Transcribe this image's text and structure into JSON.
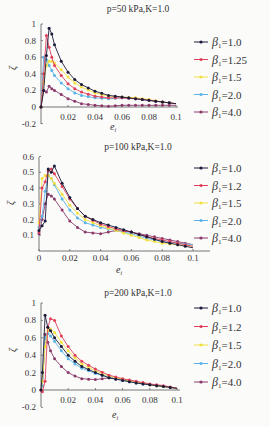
{
  "chart_data": [
    {
      "type": "line",
      "title": "p=50 kPa,K=1.0",
      "xlabel": "e_i",
      "ylabel": "ζ",
      "xlim": [
        0,
        0.1
      ],
      "ylim": [
        -0.2,
        1.0
      ],
      "xticks": [
        "0.02",
        "0.04",
        "0.06",
        "0.08",
        "0.1"
      ],
      "yticks": [
        "-0.2",
        "0",
        "0.2",
        "0.4",
        "0.6",
        "0.8",
        "1"
      ],
      "legend_position": "right",
      "series": [
        {
          "name": "β1=1.0",
          "color": "#1a1a3a",
          "x": [
            0,
            0.002,
            0.004,
            0.006,
            0.008,
            0.01,
            0.015,
            0.02,
            0.025,
            0.03,
            0.04,
            0.05,
            0.06,
            0.07,
            0.08,
            0.09,
            0.1
          ],
          "y": [
            0,
            0.2,
            0.62,
            0.95,
            0.88,
            0.75,
            0.55,
            0.42,
            0.33,
            0.27,
            0.19,
            0.14,
            0.12,
            0.1,
            0.08,
            0.06,
            0.04
          ]
        },
        {
          "name": "β1=1.25",
          "color": "#e0405a",
          "x": [
            0,
            0.002,
            0.004,
            0.006,
            0.008,
            0.01,
            0.015,
            0.02,
            0.025,
            0.03,
            0.04,
            0.05,
            0.06,
            0.07,
            0.08,
            0.09,
            0.1
          ],
          "y": [
            0,
            0.4,
            0.86,
            0.72,
            0.6,
            0.5,
            0.38,
            0.28,
            0.22,
            0.18,
            0.13,
            0.11,
            0.11,
            0.1,
            0.08,
            0.06,
            0.04
          ]
        },
        {
          "name": "β1=1.5",
          "color": "#f2e040",
          "x": [
            0,
            0.002,
            0.004,
            0.006,
            0.008,
            0.01,
            0.015,
            0.02,
            0.025,
            0.03,
            0.04,
            0.05,
            0.06,
            0.07,
            0.08,
            0.09,
            0.1
          ],
          "y": [
            0,
            0.3,
            0.5,
            0.55,
            0.55,
            0.53,
            0.45,
            0.36,
            0.29,
            0.24,
            0.17,
            0.13,
            0.12,
            0.11,
            0.09,
            0.06,
            0.04
          ]
        },
        {
          "name": "β1=2.0",
          "color": "#5ab4e6",
          "x": [
            0,
            0.002,
            0.004,
            0.006,
            0.008,
            0.01,
            0.015,
            0.02,
            0.025,
            0.03,
            0.04,
            0.05,
            0.06,
            0.07,
            0.08,
            0.09,
            0.1
          ],
          "y": [
            0,
            0.6,
            0.57,
            0.5,
            0.44,
            0.38,
            0.29,
            0.22,
            0.17,
            0.14,
            0.11,
            0.1,
            0.11,
            0.1,
            0.08,
            0.06,
            0.04
          ]
        },
        {
          "name": "β1=4.0",
          "color": "#8a3a6a",
          "x": [
            0,
            0.002,
            0.004,
            0.006,
            0.008,
            0.01,
            0.015,
            0.02,
            0.025,
            0.03,
            0.04,
            0.05,
            0.06,
            0.07,
            0.08,
            0.09,
            0.1
          ],
          "y": [
            0,
            0.2,
            0.18,
            0.25,
            0.22,
            0.2,
            0.15,
            0.1,
            0.07,
            0.04,
            0.02,
            0.01,
            0.02,
            0.02,
            0.02,
            0.02,
            0.02
          ]
        }
      ]
    },
    {
      "type": "line",
      "title": "p=100 kPa,K=1.0",
      "xlabel": "e_i",
      "ylabel": "ζ",
      "xlim": [
        0,
        0.11
      ],
      "ylim": [
        0,
        0.6
      ],
      "xticks": [
        "0",
        "0.02",
        "0.04",
        "0.06",
        "0.08",
        "0.1"
      ],
      "yticks": [
        "0.1",
        "0.2",
        "0.3",
        "0.4",
        "0.5",
        "0.6"
      ],
      "legend_position": "right",
      "series": [
        {
          "name": "β1=1.0",
          "color": "#1a1a3a",
          "x": [
            0,
            0.002,
            0.004,
            0.006,
            0.008,
            0.01,
            0.015,
            0.02,
            0.025,
            0.03,
            0.04,
            0.05,
            0.06,
            0.07,
            0.08,
            0.09,
            0.1
          ],
          "y": [
            0.13,
            0.16,
            0.19,
            0.52,
            0.5,
            0.54,
            0.43,
            0.34,
            0.27,
            0.22,
            0.18,
            0.15,
            0.12,
            0.09,
            0.06,
            0.04,
            0.02
          ]
        },
        {
          "name": "β1=1.2",
          "color": "#e0405a",
          "x": [
            0,
            0.002,
            0.004,
            0.006,
            0.008,
            0.01,
            0.015,
            0.02,
            0.025,
            0.03,
            0.04,
            0.05,
            0.06,
            0.07,
            0.08,
            0.09,
            0.1
          ],
          "y": [
            0.12,
            0.4,
            0.44,
            0.51,
            0.52,
            0.49,
            0.41,
            0.33,
            0.27,
            0.22,
            0.17,
            0.14,
            0.12,
            0.09,
            0.07,
            0.05,
            0.03
          ]
        },
        {
          "name": "β1=1.5",
          "color": "#f2e040",
          "x": [
            0,
            0.002,
            0.004,
            0.006,
            0.008,
            0.01,
            0.015,
            0.02,
            0.025,
            0.03,
            0.04,
            0.05,
            0.06,
            0.07,
            0.08,
            0.09,
            0.1
          ],
          "y": [
            0.18,
            0.46,
            0.48,
            0.48,
            0.46,
            0.43,
            0.36,
            0.29,
            0.24,
            0.2,
            0.16,
            0.13,
            0.1,
            0.07,
            0.05,
            0.04,
            0.03
          ]
        },
        {
          "name": "β1=2.0",
          "color": "#5ab4e6",
          "x": [
            0,
            0.002,
            0.004,
            0.006,
            0.008,
            0.01,
            0.015,
            0.02,
            0.025,
            0.03,
            0.04,
            0.05,
            0.06,
            0.07,
            0.08,
            0.09,
            0.1
          ],
          "y": [
            0.15,
            0.22,
            0.38,
            0.48,
            0.46,
            0.42,
            0.33,
            0.26,
            0.21,
            0.18,
            0.15,
            0.13,
            0.11,
            0.08,
            0.06,
            0.05,
            0.04
          ]
        },
        {
          "name": "β1=4.0",
          "color": "#8a3a6a",
          "x": [
            0,
            0.002,
            0.004,
            0.006,
            0.008,
            0.01,
            0.015,
            0.02,
            0.025,
            0.03,
            0.04,
            0.05,
            0.06,
            0.07,
            0.08,
            0.09,
            0.1
          ],
          "y": [
            0.11,
            0.2,
            0.3,
            0.36,
            0.35,
            0.33,
            0.26,
            0.19,
            0.15,
            0.12,
            0.11,
            0.13,
            0.12,
            0.1,
            0.08,
            0.06,
            0.04
          ]
        }
      ]
    },
    {
      "type": "line",
      "title": "p=200 kPa,K=1.0",
      "xlabel": "e_i",
      "ylabel": "ζ",
      "xlim": [
        0,
        0.1
      ],
      "ylim": [
        -0.2,
        1.0
      ],
      "xticks": [
        "0.02",
        "0.04",
        "0.06",
        "0.08",
        "0.1"
      ],
      "yticks": [
        "-0.2",
        "0",
        "0.2",
        "0.4",
        "0.6",
        "0.8",
        "1"
      ],
      "legend_position": "right",
      "series": [
        {
          "name": "β1=1.0",
          "color": "#1a1a3a",
          "x": [
            0,
            0.001,
            0.003,
            0.005,
            0.007,
            0.01,
            0.015,
            0.02,
            0.025,
            0.03,
            0.04,
            0.05,
            0.06,
            0.07,
            0.08,
            0.09,
            0.1
          ],
          "y": [
            0,
            0.2,
            0.86,
            0.72,
            0.68,
            0.6,
            0.5,
            0.4,
            0.33,
            0.27,
            0.2,
            0.14,
            0.11,
            0.08,
            0.06,
            0.04,
            0.02
          ]
        },
        {
          "name": "β1=1.2",
          "color": "#e0405a",
          "x": [
            0,
            0.001,
            0.003,
            0.005,
            0.007,
            0.01,
            0.015,
            0.02,
            0.025,
            0.03,
            0.04,
            0.05,
            0.06,
            0.07,
            0.08,
            0.09,
            0.1
          ],
          "y": [
            0,
            -0.02,
            0.1,
            0.72,
            0.82,
            0.8,
            0.62,
            0.5,
            0.4,
            0.33,
            0.24,
            0.17,
            0.13,
            0.1,
            0.07,
            0.05,
            0.02
          ]
        },
        {
          "name": "β1=1.5",
          "color": "#f2e040",
          "x": [
            0,
            0.001,
            0.003,
            0.005,
            0.007,
            0.01,
            0.015,
            0.02,
            0.025,
            0.03,
            0.04,
            0.05,
            0.06,
            0.07,
            0.08,
            0.09,
            0.1
          ],
          "y": [
            0,
            0.1,
            0.5,
            0.68,
            0.7,
            0.66,
            0.55,
            0.45,
            0.37,
            0.3,
            0.22,
            0.16,
            0.12,
            0.09,
            0.06,
            0.04,
            0.02
          ]
        },
        {
          "name": "β1=2.0",
          "color": "#5ab4e6",
          "x": [
            0,
            0.001,
            0.003,
            0.005,
            0.007,
            0.01,
            0.015,
            0.02,
            0.025,
            0.03,
            0.04,
            0.05,
            0.06,
            0.07,
            0.08,
            0.09,
            0.1
          ],
          "y": [
            0,
            0.05,
            0.6,
            0.65,
            0.62,
            0.56,
            0.45,
            0.36,
            0.3,
            0.25,
            0.19,
            0.15,
            0.11,
            0.08,
            0.06,
            0.04,
            0.02
          ]
        },
        {
          "name": "β1=4.0",
          "color": "#8a3a6a",
          "x": [
            0,
            0.001,
            0.003,
            0.005,
            0.007,
            0.01,
            0.015,
            0.02,
            0.025,
            0.03,
            0.04,
            0.05,
            0.06,
            0.07,
            0.08,
            0.09,
            0.1
          ],
          "y": [
            0,
            0.05,
            0.64,
            0.55,
            0.45,
            0.36,
            0.27,
            0.2,
            0.16,
            0.13,
            0.12,
            0.14,
            0.12,
            0.09,
            0.06,
            0.04,
            0.02
          ]
        }
      ]
    }
  ],
  "panels": [
    {
      "title": "p=50 kPa,K=1.0",
      "xlabel": "e",
      "xlabel_sub": "i",
      "ylabel": "ζ",
      "legend": [
        {
          "label": "=1.0"
        },
        {
          "label": "=1.25"
        },
        {
          "label": "=1.5"
        },
        {
          "label": "=2.0"
        },
        {
          "label": "=4.0"
        }
      ]
    },
    {
      "title": "p=100 kPa,K=1.0",
      "xlabel": "e",
      "xlabel_sub": "i",
      "ylabel": "ζ",
      "legend": [
        {
          "label": "=1.0"
        },
        {
          "label": "=1.2"
        },
        {
          "label": "=1.5"
        },
        {
          "label": "=2.0"
        },
        {
          "label": "=4.0"
        }
      ]
    },
    {
      "title": "p=200 kPa,K=1.0",
      "xlabel": "e",
      "xlabel_sub": "i",
      "ylabel": "ζ",
      "legend": [
        {
          "label": "=1.0"
        },
        {
          "label": "=1.2"
        },
        {
          "label": "=1.5"
        },
        {
          "label": "=2.0"
        },
        {
          "label": "=4.0"
        }
      ]
    }
  ],
  "legend_symbol": "β",
  "legend_sub": "1"
}
